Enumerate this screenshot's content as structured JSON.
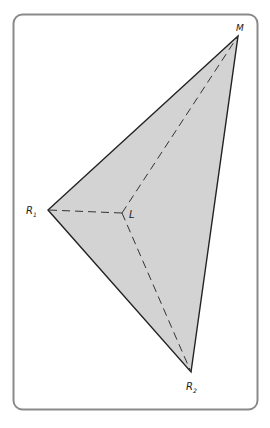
{
  "diagram": {
    "type": "triangle-with-interior-point",
    "frame": {
      "x": 13,
      "y": 14,
      "width": 244,
      "height": 395,
      "radius": 9,
      "stroke": "#8a8a8a"
    },
    "fill_color": "#d3d3d3",
    "edge_color": "#222222",
    "dash_color": "#333333",
    "vertices": {
      "M": {
        "x": 238,
        "y": 36,
        "label": "M",
        "sub": ""
      },
      "R1": {
        "x": 48,
        "y": 210,
        "label": "R",
        "sub": "1"
      },
      "R2": {
        "x": 191,
        "y": 372,
        "label": "R",
        "sub": "2"
      }
    },
    "interior_point": {
      "x": 122,
      "y": 213,
      "label": "L"
    },
    "dashed_segments": [
      [
        "L",
        "M"
      ],
      [
        "L",
        "R1"
      ],
      [
        "L",
        "R2"
      ]
    ]
  }
}
